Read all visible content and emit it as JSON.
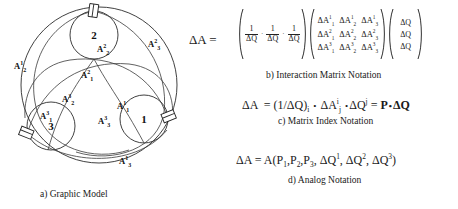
{
  "figure": {
    "panels": [
      {
        "id": "a",
        "caption": "a) Graphic Model"
      },
      {
        "id": "b",
        "caption": "b) Interaction Matrix Notation"
      },
      {
        "id": "c",
        "caption": "c) Matrix Index Notation"
      },
      {
        "id": "d",
        "caption": "d) Analog Notation"
      }
    ]
  },
  "graphic_model": {
    "nodes": [
      {
        "label": "1",
        "name": "node-1"
      },
      {
        "label": "2",
        "name": "node-2"
      },
      {
        "label": "3",
        "name": "node-3"
      }
    ],
    "arc_labels": [
      {
        "id": "A2_2",
        "base": "A",
        "sup": "2",
        "sub": "2"
      },
      {
        "id": "A2_1",
        "base": "A",
        "sup": "2",
        "sub": "1"
      },
      {
        "id": "A2_3",
        "base": "A",
        "sup": "2",
        "sub": "3"
      },
      {
        "id": "A3_2",
        "base": "A",
        "sup": "3",
        "sub": "2"
      },
      {
        "id": "A3_1",
        "base": "A",
        "sup": "3",
        "sub": "1"
      },
      {
        "id": "A3_3",
        "base": "A",
        "sup": "3",
        "sub": "3"
      },
      {
        "id": "A1_1",
        "base": "A",
        "sup": "1",
        "sub": "1"
      },
      {
        "id": "A1_2",
        "base": "A",
        "sup": "1",
        "sub": "2"
      },
      {
        "id": "A1_3",
        "base": "A",
        "sup": "1",
        "sub": "3"
      }
    ]
  },
  "interaction_matrix": {
    "lhs": "ΔA",
    "equals": "=",
    "row_vector": {
      "entries": [
        {
          "num": "1",
          "den": "ΔQ"
        },
        {
          "num": "1",
          "den": "ΔQ"
        },
        {
          "num": "1",
          "den": "ΔQ"
        }
      ],
      "separator": "·"
    },
    "matrix": [
      [
        {
          "base": "ΔA",
          "sup": "1",
          "sub": "1"
        },
        {
          "base": "ΔA",
          "sup": "1",
          "sub": "2"
        },
        {
          "base": "ΔA",
          "sup": "1",
          "sub": "3"
        }
      ],
      [
        {
          "base": "ΔA",
          "sup": "2",
          "sub": "1"
        },
        {
          "base": "ΔA",
          "sup": "2",
          "sub": "2"
        },
        {
          "base": "ΔA",
          "sup": "2",
          "sub": "3"
        }
      ],
      [
        {
          "base": "ΔA",
          "sup": "3",
          "sub": "1"
        },
        {
          "base": "ΔA",
          "sup": "3",
          "sub": "2"
        },
        {
          "base": "ΔA",
          "sup": "3",
          "sub": "3"
        }
      ]
    ],
    "column_vector": [
      "ΔQ",
      "ΔQ",
      "ΔQ"
    ]
  },
  "matrix_index": {
    "lhs": "ΔA",
    "equals": "=",
    "term1_open": "(1/ΔQ)",
    "term1_sub": "i",
    "dot1": "•",
    "term2_base": "ΔA",
    "term2_sup": "i",
    "term2_sub": "j",
    "dot2": "•",
    "term3_base": "ΔQ",
    "term3_sup": "j",
    "equals2": "=",
    "result_p": "P",
    "result_dot": "•",
    "result_q": "ΔQ"
  },
  "analog": {
    "lhs": "ΔA",
    "equals": "=",
    "fn": "A(",
    "p1": "P",
    "p1sub": "1",
    "c1": ",",
    "p2": "P",
    "p2sub": "2",
    "c2": ",",
    "p3": "P",
    "p3sub": "3",
    "c3": ",",
    "q1": "ΔQ",
    "q1sup": "1",
    "c4": ",",
    "q2": "ΔQ",
    "q2sup": "2",
    "c5": ",",
    "q3": "ΔQ",
    "q3sup": "3",
    "close": ")"
  },
  "colors": {
    "stroke": "#2b2b2b",
    "text": "#1a1a1a",
    "background": "#ffffff"
  }
}
